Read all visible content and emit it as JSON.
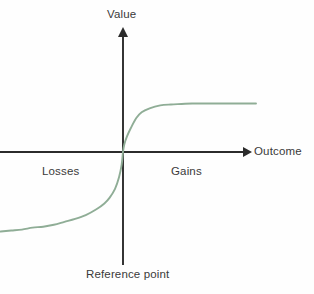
{
  "figure": {
    "background_color": "#fefefe",
    "width": 314,
    "height": 294
  },
  "labels": {
    "value_axis": "Value",
    "outcome_axis": "Outcome",
    "losses_region": "Losses",
    "gains_region": "Gains",
    "reference_point": "Reference point"
  },
  "style": {
    "axis_color": "#2b2b2b",
    "curve_color": "#8fad96",
    "text_color": "#3a3a3a"
  },
  "chart_data": {
    "type": "line",
    "title": "",
    "subtitle": "",
    "xlabel": "Outcome",
    "ylabel": "Value",
    "grid": false,
    "legend": "none",
    "xlim": [
      -1,
      1
    ],
    "ylim": [
      -1,
      1
    ],
    "axis_origin_label": "Reference point",
    "tick_labels": {
      "x": [],
      "y": []
    },
    "annotations": [
      {
        "text": "Losses",
        "x": -0.55,
        "y": -0.12
      },
      {
        "text": "Gains",
        "x": 0.4,
        "y": -0.12
      },
      {
        "text": "Reference point",
        "x": 0.0,
        "y": -0.98
      },
      {
        "text": "Value",
        "x": 0.0,
        "y": 1.0
      },
      {
        "text": "Outcome",
        "x": 1.0,
        "y": 0.0
      }
    ],
    "series": [
      {
        "name": "Prospect theory value function",
        "color": "#8fad96",
        "x": [
          -1.0,
          -0.92,
          -0.84,
          -0.76,
          -0.68,
          -0.6,
          -0.52,
          -0.44,
          -0.36,
          -0.28,
          -0.2,
          -0.14,
          -0.1,
          -0.06,
          -0.03,
          -0.01,
          0.0,
          0.01,
          0.03,
          0.06,
          0.1,
          0.14,
          0.2,
          0.28,
          0.36,
          0.44,
          0.52,
          0.6,
          0.68,
          0.76,
          0.84,
          0.92,
          1.0
        ],
        "y": [
          -0.83,
          -0.82,
          -0.81,
          -0.8,
          -0.78,
          -0.77,
          -0.75,
          -0.72,
          -0.69,
          -0.65,
          -0.59,
          -0.53,
          -0.47,
          -0.38,
          -0.26,
          -0.13,
          0.0,
          0.08,
          0.16,
          0.25,
          0.35,
          0.41,
          0.45,
          0.48,
          0.49,
          0.495,
          0.5,
          0.5,
          0.5,
          0.5,
          0.5,
          0.5,
          0.5
        ]
      }
    ]
  }
}
